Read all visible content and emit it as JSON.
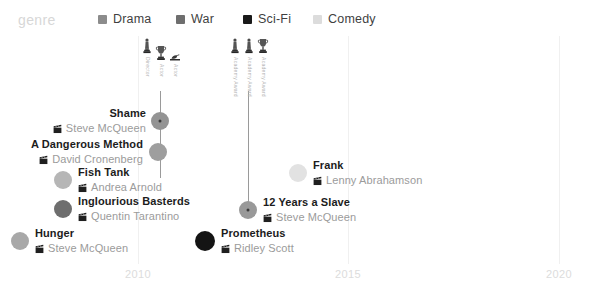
{
  "legend": {
    "title": "genre",
    "items": [
      {
        "label": "Drama",
        "color": "#8c8c8c",
        "x": 98
      },
      {
        "label": "War",
        "color": "#6e6e6e",
        "x": 176
      },
      {
        "label": "Sci-Fi",
        "color": "#1a1a1a",
        "x": 243
      },
      {
        "label": "Comedy",
        "color": "#dcdcdc",
        "x": 313
      }
    ]
  },
  "axis": {
    "ticks": [
      {
        "label": "2010",
        "x": 138
      },
      {
        "label": "2015",
        "x": 348
      },
      {
        "label": "2020",
        "x": 559
      }
    ],
    "grid_top": 0,
    "grid_height": 228,
    "tick_label_y": 232
  },
  "awards": {
    "icon_label": "Academy Award",
    "groups": [
      {
        "name": "shame-awards",
        "x": 160,
        "stem_top": 55,
        "stem_height": 87,
        "icons": [
          {
            "glyph": "oscar",
            "text": "Director"
          },
          {
            "glyph": "trophy",
            "text": "Actor"
          },
          {
            "glyph": "laurel",
            "text": "Actor"
          }
        ]
      },
      {
        "name": "twelve-years-awards",
        "x": 248,
        "stem_top": 55,
        "stem_height": 120,
        "icons": [
          {
            "glyph": "oscar",
            "text": "Academy Award"
          },
          {
            "glyph": "oscar",
            "text": "Academy Award"
          },
          {
            "glyph": "trophy",
            "text": "Academy Award"
          }
        ]
      }
    ]
  },
  "chart_data": {
    "type": "scatter",
    "title": "genre",
    "xlabel": "",
    "ylabel": "",
    "xlim": [
      2009,
      2020
    ],
    "xticks": [
      2010,
      2015,
      2020
    ],
    "grid": true,
    "legend_position": "top",
    "categories": [
      "Drama",
      "War",
      "Sci-Fi",
      "Comedy"
    ],
    "points": [
      {
        "title": "Shame",
        "director": "Steve McQueen",
        "genre": "Drama",
        "color": "#949494",
        "cx": 160,
        "cy": 85,
        "r": 9,
        "label_side": "left",
        "label_x": 146,
        "label_y": 85,
        "has_award": true
      },
      {
        "title": "A Dangerous Method",
        "director": "David Cronenberg",
        "genre": "Drama",
        "color": "#9e9e9e",
        "cx": 158,
        "cy": 116,
        "r": 9,
        "label_side": "left",
        "label_x": 143,
        "label_y": 116,
        "has_award": false
      },
      {
        "title": "Fish Tank",
        "director": "Andrea Arnold",
        "genre": "Drama",
        "color": "#b6b6b6",
        "cx": 63,
        "cy": 144,
        "r": 9,
        "label_side": "right",
        "label_x": 78,
        "label_y": 144,
        "has_award": false
      },
      {
        "title": "Inglourious Basterds",
        "director": "Quentin Tarantino",
        "genre": "War",
        "color": "#6e6e6e",
        "cx": 63,
        "cy": 173,
        "r": 9,
        "label_side": "right",
        "label_x": 78,
        "label_y": 173,
        "has_award": false
      },
      {
        "title": "Hunger",
        "director": "Steve McQueen",
        "genre": "Drama",
        "color": "#a8a8a8",
        "cx": 20,
        "cy": 205,
        "r": 9,
        "label_side": "right",
        "label_x": 35,
        "label_y": 205,
        "has_award": false
      },
      {
        "title": "Prometheus",
        "director": "Ridley Scott",
        "genre": "Sci-Fi",
        "color": "#141414",
        "cx": 205,
        "cy": 205,
        "r": 10,
        "label_side": "right",
        "label_x": 221,
        "label_y": 205,
        "has_award": false
      },
      {
        "title": "Frank",
        "director": "Lenny Abrahamson",
        "genre": "Comedy",
        "color": "#e2e2e2",
        "cx": 298,
        "cy": 137,
        "r": 9,
        "label_side": "right",
        "label_x": 313,
        "label_y": 137,
        "has_award": false
      },
      {
        "title": "12 Years a Slave",
        "director": "Steve McQueen",
        "genre": "Drama",
        "color": "#999999",
        "cx": 248,
        "cy": 174,
        "r": 9,
        "label_side": "right",
        "label_x": 263,
        "label_y": 174,
        "has_award": true
      }
    ]
  }
}
